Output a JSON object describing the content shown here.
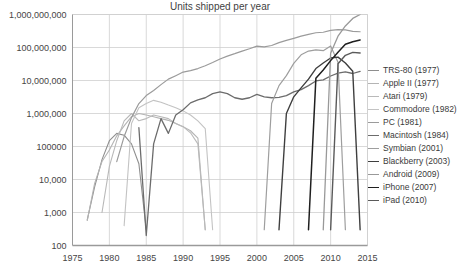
{
  "chart_data": {
    "type": "line",
    "title": "Units shipped per year",
    "xlabel": "",
    "ylabel": "",
    "yscale": "log",
    "ylim": [
      100,
      1000000000
    ],
    "xlim": [
      1975,
      2015
    ],
    "grid": true,
    "legend_position": "right",
    "ytick_labels": [
      "1,000,000,000",
      "100,000,000",
      "10,000,000",
      "1,000,000",
      "100000",
      "10,000",
      "1,000",
      "100"
    ],
    "ytick_values": [
      1000000000,
      100000000,
      10000000,
      1000000,
      100000,
      10000,
      1000,
      100
    ],
    "xtick_labels": [
      "1975",
      "1980",
      "1985",
      "1990",
      "1995",
      "2000",
      "2005",
      "2010",
      "2015"
    ],
    "xtick_values": [
      1975,
      1980,
      1985,
      1990,
      1995,
      2000,
      2005,
      2010,
      2015
    ],
    "series": [
      {
        "name": "TRS-80 (1977)",
        "label": "TRS-80 (1977)",
        "year": 1977,
        "color": "#8e8e8e",
        "width": 1.1,
        "x": [
          1977,
          1978,
          1979,
          1980,
          1981,
          1982,
          1983,
          1984,
          1985
        ],
        "y": [
          600,
          6000,
          40000,
          150000,
          250000,
          220000,
          120000,
          30000,
          300
        ]
      },
      {
        "name": "Apple II (1977)",
        "label": "Apple II (1977)",
        "year": 1977,
        "color": "#b4b4b4",
        "width": 1.1,
        "x": [
          1977,
          1978,
          1979,
          1980,
          1981,
          1982,
          1983,
          1984,
          1985,
          1986,
          1987,
          1988,
          1989,
          1990,
          1991,
          1992,
          1993
        ],
        "y": [
          570,
          7600,
          35000,
          78000,
          210000,
          420000,
          800000,
          1000000,
          900000,
          800000,
          700000,
          620000,
          500000,
          400000,
          300000,
          180000,
          300
        ]
      },
      {
        "name": "Atari (1979)",
        "label": "Atari (1979)",
        "year": 1979,
        "color": "#b9b9b9",
        "width": 1.1,
        "x": [
          1979,
          1980,
          1981,
          1982,
          1983,
          1984,
          1985,
          1986,
          1987,
          1988,
          1989,
          1990,
          1991,
          1992,
          1993
        ],
        "y": [
          1000,
          25000,
          150000,
          600000,
          1000000,
          600000,
          700000,
          900000,
          800000,
          700000,
          500000,
          400000,
          260000,
          120000,
          300
        ]
      },
      {
        "name": "Commodore (1982)",
        "label": "Commodore (1982)",
        "year": 1982,
        "color": "#c3c3c3",
        "width": 1.1,
        "x": [
          1982,
          1983,
          1984,
          1985,
          1986,
          1987,
          1988,
          1989,
          1990,
          1991,
          1992,
          1993,
          1994
        ],
        "y": [
          400,
          500000,
          1500000,
          2000000,
          2500000,
          2200000,
          1800000,
          1500000,
          1200000,
          900000,
          600000,
          350000,
          300
        ]
      },
      {
        "name": "PC (1981)",
        "label": "PC (1981)",
        "year": 1981,
        "color": "#9b9b9b",
        "width": 1.2,
        "x": [
          1981,
          1982,
          1983,
          1984,
          1985,
          1986,
          1987,
          1988,
          1989,
          1990,
          1991,
          1992,
          1993,
          1994,
          1995,
          1996,
          1997,
          1998,
          1999,
          2000,
          2001,
          2002,
          2003,
          2004,
          2005,
          2006,
          2007,
          2008,
          2009,
          2010,
          2011,
          2012,
          2013,
          2014
        ],
        "y": [
          35000,
          200000,
          750000,
          2000000,
          3500000,
          5000000,
          7500000,
          11000000,
          14000000,
          18000000,
          20000000,
          23000000,
          28000000,
          35000000,
          45000000,
          55000000,
          65000000,
          78000000,
          92000000,
          110000000,
          105000000,
          115000000,
          140000000,
          165000000,
          190000000,
          220000000,
          250000000,
          280000000,
          290000000,
          330000000,
          350000000,
          340000000,
          310000000,
          300000000
        ]
      },
      {
        "name": "Macintosh (1984)",
        "label": "Macintosh (1984)",
        "year": 1984,
        "color": "#6c6c6c",
        "width": 1.3,
        "x": [
          1984,
          1985,
          1986,
          1987,
          1988,
          1989,
          1990,
          1991,
          1992,
          1993,
          1994,
          1995,
          1996,
          1997,
          1998,
          1999,
          2000,
          2001,
          2002,
          2003,
          2004,
          2005,
          2006,
          2007,
          2008,
          2009,
          2010,
          2011,
          2012,
          2013,
          2014
        ],
        "y": [
          372000,
          200,
          120000,
          700000,
          250000,
          900000,
          1300000,
          2100000,
          2600000,
          3000000,
          4000000,
          4500000,
          4000000,
          3000000,
          2700000,
          3000000,
          3800000,
          3200000,
          3000000,
          3100000,
          3500000,
          4500000,
          5300000,
          7000000,
          9700000,
          10400000,
          13700000,
          16700000,
          18200000,
          16300000,
          18900000
        ]
      },
      {
        "name": "Symbian (2001)",
        "label": "Symbian (2001)",
        "year": 2001,
        "color": "#9e9e9e",
        "width": 1.2,
        "x": [
          2001,
          2002,
          2003,
          2004,
          2005,
          2006,
          2007,
          2008,
          2009,
          2010,
          2011,
          2012
        ],
        "y": [
          300,
          2000000,
          7000000,
          14000000,
          33000000,
          60000000,
          78000000,
          85000000,
          80000000,
          111000000,
          36000000,
          300
        ]
      },
      {
        "name": "Blackberry (2003)",
        "label": "Blackberry (2003)",
        "year": 2003,
        "color": "#3f3f3f",
        "width": 1.4,
        "x": [
          2003,
          2004,
          2005,
          2006,
          2007,
          2008,
          2009,
          2010,
          2011,
          2012,
          2013,
          2014
        ],
        "y": [
          300,
          1000000,
          3200000,
          6000000,
          11000000,
          23000000,
          34000000,
          48000000,
          51000000,
          34000000,
          19000000,
          300
        ]
      },
      {
        "name": "Android (2009)",
        "label": "Android (2009)",
        "year": 2009,
        "color": "#999999",
        "width": 1.3,
        "x": [
          2009,
          2010,
          2011,
          2012,
          2013,
          2014
        ],
        "y": [
          300,
          67000000,
          220000000,
          450000000,
          760000000,
          1000000000
        ]
      },
      {
        "name": "iPhone (2007)",
        "label": "iPhone (2007)",
        "year": 2007,
        "color": "#1f1f1f",
        "width": 1.5,
        "x": [
          2007,
          2008,
          2009,
          2010,
          2011,
          2012,
          2013,
          2014
        ],
        "y": [
          300,
          11600000,
          20700000,
          40000000,
          72000000,
          125000000,
          150000000,
          170000000
        ]
      },
      {
        "name": "iPad (2010)",
        "label": "iPad (2010)",
        "year": 2010,
        "color": "#5a5a5a",
        "width": 1.4,
        "x": [
          2010,
          2011,
          2012,
          2013,
          2014
        ],
        "y": [
          300,
          32000000,
          58000000,
          71000000,
          68000000
        ]
      }
    ]
  }
}
